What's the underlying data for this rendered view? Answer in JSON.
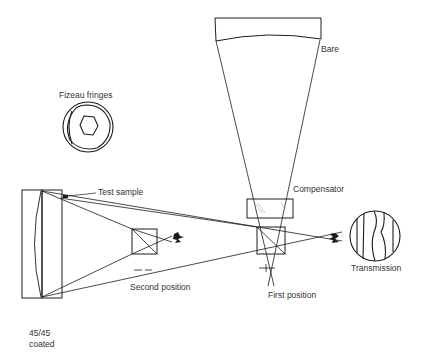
{
  "diagram": {
    "type": "optical-test-setup",
    "labels": {
      "bare": "Bare",
      "fizeau_fringes": "Fizeau fringes",
      "test_sample": "Test sample",
      "compensator": "Compensator",
      "transmission": "Transmission",
      "second_position": "Second position",
      "first_position": "First position",
      "coating_ratio": "45/45",
      "coating_state": "coated"
    },
    "components": [
      {
        "id": "bare-mirror",
        "label": "Bare"
      },
      {
        "id": "left-mirror-assembly",
        "label": "45/45 coated"
      },
      {
        "id": "test-sample",
        "label": "Test sample"
      },
      {
        "id": "second-position-beamsplitter",
        "label": "Second position"
      },
      {
        "id": "first-position-beamsplitter",
        "label": "First position"
      },
      {
        "id": "compensator-plate",
        "label": "Compensator"
      },
      {
        "id": "fizeau-fringe-pattern",
        "label": "Fizeau fringes"
      },
      {
        "id": "transmission-fringe-pattern",
        "label": "Transmission"
      }
    ],
    "colors": {
      "line": "#1c1c1c",
      "text": "#333333",
      "background": "#ffffff"
    }
  }
}
